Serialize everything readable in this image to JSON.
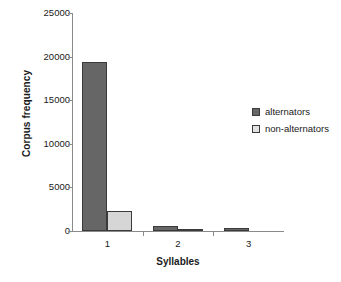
{
  "chart_data": {
    "type": "bar",
    "title": "",
    "xlabel": "Syllables",
    "ylabel": "Corpus frequency",
    "categories": [
      "1",
      "2",
      "3"
    ],
    "series": [
      {
        "name": "alternators",
        "color": "#666666",
        "values": [
          19400,
          600,
          400
        ]
      },
      {
        "name": "non-alternators",
        "color": "#d6d6d6",
        "values": [
          2300,
          200,
          0
        ]
      }
    ],
    "ylim": [
      0,
      25000
    ],
    "yticks": [
      0,
      5000,
      10000,
      15000,
      20000,
      25000
    ],
    "ytick_labels": [
      "0",
      "5000",
      "10000",
      "15000",
      "20000",
      "25000"
    ],
    "grid": false,
    "legend_position": "right"
  },
  "axes": {
    "y_title": "Corpus frequency",
    "x_title": "Syllables",
    "y_ticks": [
      {
        "label": "25000",
        "value": 25000
      },
      {
        "label": "20000",
        "value": 20000
      },
      {
        "label": "15000",
        "value": 15000
      },
      {
        "label": "10000",
        "value": 10000
      },
      {
        "label": "5000",
        "value": 5000
      },
      {
        "label": "0",
        "value": 0
      }
    ],
    "x_ticks": [
      {
        "label": "1"
      },
      {
        "label": "2"
      },
      {
        "label": "3"
      }
    ]
  },
  "legend": {
    "items": [
      {
        "label": "alternators",
        "swatch": "legend-swatch-alternators"
      },
      {
        "label": "non-alternators",
        "swatch": "legend-swatch-non-alternators"
      }
    ]
  },
  "caption": {
    "sliver": ""
  }
}
